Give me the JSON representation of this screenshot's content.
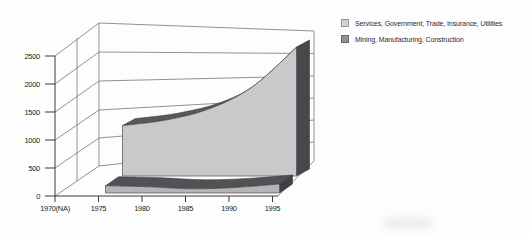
{
  "chart_data": {
    "type": "area",
    "style": "3d-perspective",
    "title": "",
    "xlabel": "",
    "ylabel": "",
    "categories": [
      "1970(NA)",
      "1975",
      "1980",
      "1985",
      "1990",
      "1995"
    ],
    "series": [
      {
        "name": "Services, Government, Trade, Insurance, Utilities",
        "values": [
          null,
          900,
          1000,
          1200,
          1600,
          2300
        ],
        "face_color": "#c9c9cb",
        "top_color": "#58585c",
        "side_color": "#48484c"
      },
      {
        "name": "Mining, Manufacturing, Construction",
        "values": [
          null,
          130,
          110,
          75,
          100,
          160
        ],
        "face_color": "#b5b5b7",
        "top_color": "#525256",
        "side_color": "#404044"
      }
    ],
    "ylim": [
      0,
      2500
    ],
    "yticks": [
      0,
      500,
      1000,
      1500,
      2000,
      2500
    ],
    "grid": true,
    "legend_position": "top-right"
  },
  "legend": {
    "items": [
      {
        "label": "Services, Government, Trade, Insurance, Utilities",
        "swatch_color": "#d0d0d2"
      },
      {
        "label": "Mining, Manufacturing, Construction",
        "swatch_color": "#919195"
      }
    ]
  },
  "colors": {
    "frame_line": "#76767a",
    "axis_line": "#3a3a3e",
    "background": "#fdfdfd"
  }
}
